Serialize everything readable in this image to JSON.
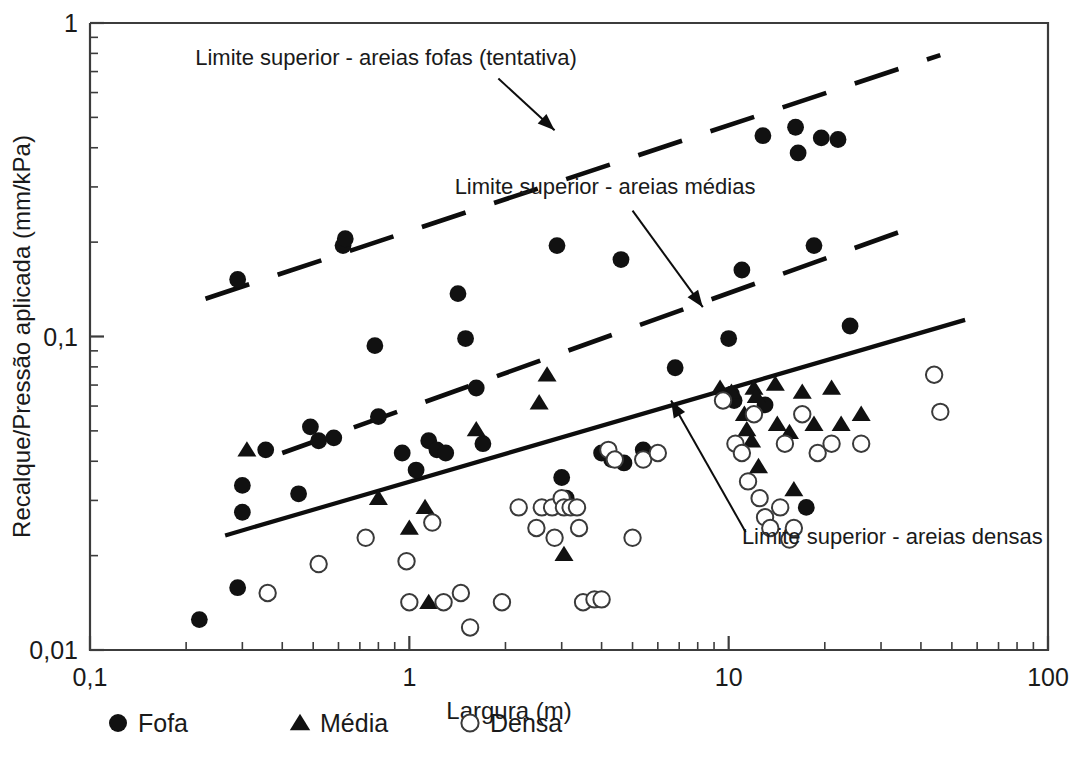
{
  "chart_data": {
    "type": "scatter",
    "title": "",
    "xlabel": "Largura (m)",
    "ylabel": "Recalque/Pressão aplicada  (mm/kPa)",
    "xscale": "log",
    "yscale": "log",
    "xlim": [
      0.1,
      100
    ],
    "ylim": [
      0.01,
      1
    ],
    "grid": false,
    "xticks": [
      "0,1",
      "1",
      "10",
      "100"
    ],
    "xtick_values": [
      0.1,
      1,
      10,
      100
    ],
    "yticks": [
      "0,01",
      "0,1",
      "1"
    ],
    "ytick_values": [
      0.01,
      0.1,
      1
    ],
    "legend_position": "below-axes",
    "series": [
      {
        "name": "Fofa",
        "marker": "filled-circle",
        "color": "#111111",
        "points": [
          [
            0.22,
            0.0125
          ],
          [
            0.29,
            0.0158
          ],
          [
            0.29,
            0.152
          ],
          [
            0.3,
            0.0335
          ],
          [
            0.3,
            0.0275
          ],
          [
            0.355,
            0.0435
          ],
          [
            0.45,
            0.0315
          ],
          [
            0.49,
            0.0515
          ],
          [
            0.52,
            0.0465
          ],
          [
            0.58,
            0.0475
          ],
          [
            0.62,
            0.195
          ],
          [
            0.63,
            0.205
          ],
          [
            0.78,
            0.0935
          ],
          [
            0.8,
            0.0555
          ],
          [
            0.95,
            0.0425
          ],
          [
            1.05,
            0.0375
          ],
          [
            1.15,
            0.0465
          ],
          [
            1.22,
            0.0435
          ],
          [
            1.3,
            0.0425
          ],
          [
            1.42,
            0.137
          ],
          [
            1.5,
            0.0985
          ],
          [
            1.62,
            0.0685
          ],
          [
            1.7,
            0.0455
          ],
          [
            2.9,
            0.195
          ],
          [
            3.0,
            0.0355
          ],
          [
            3.1,
            0.0305
          ],
          [
            4.0,
            0.0425
          ],
          [
            4.3,
            0.0405
          ],
          [
            4.6,
            0.176
          ],
          [
            4.7,
            0.0395
          ],
          [
            5.4,
            0.0435
          ],
          [
            6.8,
            0.0795
          ],
          [
            10.0,
            0.0985
          ],
          [
            10.2,
            0.0655
          ],
          [
            10.4,
            0.0625
          ],
          [
            11.0,
            0.163
          ],
          [
            12.8,
            0.437
          ],
          [
            13.0,
            0.0605
          ],
          [
            16.2,
            0.465
          ],
          [
            16.5,
            0.385
          ],
          [
            17.5,
            0.0285
          ],
          [
            18.5,
            0.195
          ],
          [
            19.5,
            0.43
          ],
          [
            22.0,
            0.425
          ],
          [
            24.0,
            0.108
          ]
        ]
      },
      {
        "name": "Média",
        "marker": "filled-triangle",
        "color": "#111111",
        "points": [
          [
            0.31,
            0.0435
          ],
          [
            0.8,
            0.0305
          ],
          [
            1.0,
            0.0245
          ],
          [
            1.12,
            0.0285
          ],
          [
            1.15,
            0.0142
          ],
          [
            1.62,
            0.0505
          ],
          [
            2.55,
            0.0615
          ],
          [
            2.7,
            0.0755
          ],
          [
            3.05,
            0.0202
          ],
          [
            9.4,
            0.0685
          ],
          [
            10.2,
            0.0665
          ],
          [
            11.2,
            0.0565
          ],
          [
            11.4,
            0.0505
          ],
          [
            11.8,
            0.0465
          ],
          [
            12.0,
            0.0685
          ],
          [
            12.2,
            0.0645
          ],
          [
            12.4,
            0.0385
          ],
          [
            14.0,
            0.0705
          ],
          [
            14.2,
            0.0525
          ],
          [
            15.5,
            0.0495
          ],
          [
            16.0,
            0.0325
          ],
          [
            17.0,
            0.0665
          ],
          [
            18.5,
            0.0525
          ],
          [
            21.0,
            0.0685
          ],
          [
            22.5,
            0.0525
          ],
          [
            26.0,
            0.0565
          ]
        ]
      },
      {
        "name": "Densa",
        "marker": "open-circle",
        "color": "#ffffff",
        "points": [
          [
            0.36,
            0.0152
          ],
          [
            0.52,
            0.0188
          ],
          [
            0.73,
            0.0228
          ],
          [
            0.98,
            0.0192
          ],
          [
            1.0,
            0.0142
          ],
          [
            1.18,
            0.0255
          ],
          [
            1.28,
            0.0142
          ],
          [
            1.45,
            0.0152
          ],
          [
            1.55,
            0.0118
          ],
          [
            1.95,
            0.0142
          ],
          [
            2.2,
            0.0285
          ],
          [
            2.5,
            0.0245
          ],
          [
            2.6,
            0.0285
          ],
          [
            2.8,
            0.0285
          ],
          [
            2.85,
            0.0228
          ],
          [
            3.0,
            0.0305
          ],
          [
            3.05,
            0.0285
          ],
          [
            3.2,
            0.0285
          ],
          [
            3.35,
            0.0285
          ],
          [
            3.4,
            0.0245
          ],
          [
            3.5,
            0.0142
          ],
          [
            3.8,
            0.0145
          ],
          [
            4.0,
            0.0145
          ],
          [
            4.2,
            0.0435
          ],
          [
            4.4,
            0.0405
          ],
          [
            5.0,
            0.0228
          ],
          [
            5.4,
            0.0405
          ],
          [
            6.0,
            0.0425
          ],
          [
            9.6,
            0.0625
          ],
          [
            10.5,
            0.0455
          ],
          [
            11.0,
            0.0425
          ],
          [
            11.5,
            0.0345
          ],
          [
            12.0,
            0.0565
          ],
          [
            12.5,
            0.0305
          ],
          [
            13.0,
            0.0265
          ],
          [
            13.5,
            0.0245
          ],
          [
            14.5,
            0.0285
          ],
          [
            15.0,
            0.0455
          ],
          [
            15.5,
            0.0225
          ],
          [
            16.0,
            0.0245
          ],
          [
            17.0,
            0.0565
          ],
          [
            19.0,
            0.0425
          ],
          [
            21.0,
            0.0455
          ],
          [
            26.0,
            0.0455
          ],
          [
            44.0,
            0.0755
          ],
          [
            46.0,
            0.0575
          ]
        ]
      }
    ],
    "annotations": [
      {
        "id": "limite-fofas",
        "text": "Limite superior - areias fofas (tentativa)",
        "text_x": 0.845,
        "text_y": 0.735,
        "arrow_from": [
          1.9,
          0.665
        ],
        "arrow_to": [
          2.85,
          0.455
        ]
      },
      {
        "id": "limite-medias",
        "text": "Limite superior - areias médias",
        "text_x": 4.1,
        "text_y": 0.285,
        "arrow_from": [
          5.0,
          0.252
        ],
        "arrow_to": [
          8.3,
          0.124
        ]
      },
      {
        "id": "limite-densas",
        "text": "Limite superior - areias densas",
        "text_x": 11.0,
        "text_y": 0.0218,
        "arrow_from": [
          11.3,
          0.0238
        ],
        "arrow_to": [
          6.6,
          0.0625
        ]
      }
    ],
    "limit_lines": [
      {
        "id": "upper-loose-sands",
        "label": "Limite superior - areias fofas (tentativa)",
        "style": "dashed",
        "x1": 0.23,
        "y1": 0.132,
        "x2": 46.0,
        "y2": 0.79
      },
      {
        "id": "upper-medium-sands",
        "label": "Limite superior - areias médias",
        "style": "dashed",
        "x1": 0.4,
        "y1": 0.0425,
        "x2": 40.0,
        "y2": 0.228
      },
      {
        "id": "upper-dense-sands",
        "label": "Limite superior - areias densas",
        "style": "solid",
        "x1": 0.265,
        "y1": 0.0232,
        "x2": 55.0,
        "y2": 0.113
      }
    ],
    "legend": [
      {
        "label": "Fofa",
        "marker": "filled-circle"
      },
      {
        "label": "Média",
        "marker": "filled-triangle"
      },
      {
        "label": "Densa",
        "marker": "open-circle"
      }
    ]
  }
}
